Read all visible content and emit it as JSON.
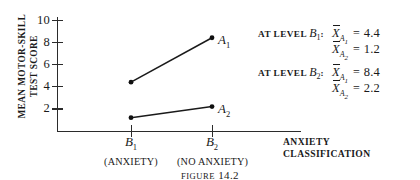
{
  "chart_data": {
    "type": "line",
    "title": "",
    "ylabel_line1": "MEAN MOTOR-SKILL",
    "ylabel_line2": "TEST SCORE",
    "xlabel_line1": "ANXIETY",
    "xlabel_line2": "CLASSIFICATION",
    "categories": [
      "B1",
      "B2"
    ],
    "category_labels": [
      "B",
      "B"
    ],
    "category_subscripts": [
      "1",
      "2"
    ],
    "category_parentheticals": [
      "(ANXIETY)",
      "(NO ANXIETY)"
    ],
    "yticks": [
      2,
      4,
      6,
      8,
      10
    ],
    "ytick_labels": [
      "2",
      "4",
      "6",
      "8",
      "10"
    ],
    "ylim": [
      0,
      11
    ],
    "grid": false,
    "legend_position": "inline-right-of-points",
    "series": [
      {
        "name": "A1",
        "label_base": "A",
        "label_sub": "1",
        "values": [
          4.4,
          8.4
        ]
      },
      {
        "name": "A2",
        "label_base": "A",
        "label_sub": "2",
        "values": [
          1.2,
          2.2
        ]
      }
    ],
    "annotations": [
      {
        "prefix": "AT LEVEL",
        "level_base": "B",
        "level_sub": "1",
        "colon": ":",
        "rows": [
          {
            "stat_base": "X",
            "stat_sub": "A",
            "stat_sub_sub": "1",
            "eq": "=",
            "value": "4.4"
          },
          {
            "stat_base": "X",
            "stat_sub": "A",
            "stat_sub_sub": "2",
            "eq": "=",
            "value": "1.2"
          }
        ]
      },
      {
        "prefix": "AT LEVEL",
        "level_base": "B",
        "level_sub": "2",
        "colon": ":",
        "rows": [
          {
            "stat_base": "X",
            "stat_sub": "A",
            "stat_sub_sub": "1",
            "eq": "=",
            "value": "8.4"
          },
          {
            "stat_base": "X",
            "stat_sub": "A",
            "stat_sub_sub": "2",
            "eq": "=",
            "value": "2.2"
          }
        ]
      }
    ]
  },
  "caption": {
    "label": "FIGURE",
    "number": "14.2"
  }
}
